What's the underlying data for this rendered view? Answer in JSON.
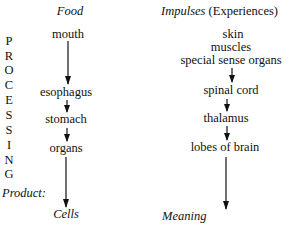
{
  "left_column": {
    "header": "Food",
    "side_label_letters": [
      "P",
      "R",
      "O",
      "C",
      "E",
      "S",
      "S",
      "I",
      "N",
      "G"
    ],
    "side_label": "PROCESSING",
    "steps": [
      "mouth",
      "esophagus",
      "stomach",
      "organs"
    ],
    "product_label": "Product:",
    "product": "Cells"
  },
  "right_column": {
    "header_italic": "Impulses",
    "header_paren": "(Experiences)",
    "sources": [
      "skin",
      "muscles",
      "special sense organs"
    ],
    "steps": [
      "spinal cord",
      "thalamus",
      "lobes of brain"
    ],
    "product": "Meaning"
  }
}
